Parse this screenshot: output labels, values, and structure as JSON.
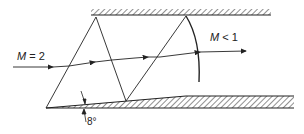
{
  "diagram": {
    "labels": {
      "inlet_mach_symbol": "M",
      "inlet_mach_rest": " = 2",
      "exit_mach_symbol": "M",
      "exit_mach_rest": " < 1",
      "wedge_angle": "8°"
    },
    "colors": {
      "line": "#222222",
      "background": "#ffffff"
    },
    "elements": [
      "upper-wall",
      "lower-wall-with-8deg-wedge",
      "incident-oblique-shock",
      "reflected-oblique-shock-1",
      "reflected-oblique-shock-2",
      "normal-shock",
      "streamline"
    ]
  }
}
